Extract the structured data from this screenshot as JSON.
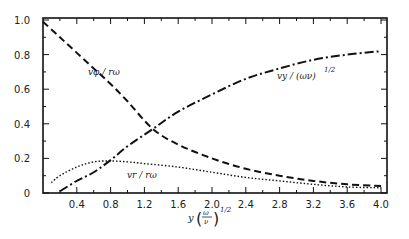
{
  "chart_data": {
    "type": "line",
    "title": "",
    "xlabel": "y(ω/ν)^1/2",
    "ylabel": "",
    "xlim": [
      0,
      4.0
    ],
    "ylim": [
      0,
      1.0
    ],
    "grid": false,
    "legend": "none (inline curve labels)",
    "x_ticks": [
      "0.4",
      "0.8",
      "1.2",
      "1.6",
      "2.0",
      "2.4",
      "2.8",
      "3.2",
      "3.6",
      "4.0"
    ],
    "y_ticks": [
      "0",
      "0.2",
      "0.4",
      "0.6",
      "0.8",
      "1.0"
    ],
    "series": [
      {
        "name": "v_φ / rω",
        "style": "dashed",
        "x": [
          0,
          0.2,
          0.4,
          0.6,
          0.8,
          1.0,
          1.3,
          1.6,
          2.0,
          2.4,
          2.8,
          3.2,
          3.6,
          4.0
        ],
        "y": [
          0.99,
          0.9,
          0.81,
          0.72,
          0.63,
          0.53,
          0.37,
          0.28,
          0.2,
          0.14,
          0.1,
          0.07,
          0.05,
          0.04
        ]
      },
      {
        "name": "v_y / (ων)^1/2",
        "style": "dash-dot",
        "x": [
          0.2,
          0.4,
          0.6,
          0.8,
          1.0,
          1.3,
          1.6,
          2.0,
          2.4,
          2.8,
          3.2,
          3.6,
          4.0
        ],
        "y": [
          0.01,
          0.07,
          0.12,
          0.19,
          0.27,
          0.37,
          0.47,
          0.57,
          0.66,
          0.72,
          0.77,
          0.8,
          0.82
        ]
      },
      {
        "name": "v_r / rω",
        "style": "dotted",
        "x": [
          0.1,
          0.2,
          0.4,
          0.6,
          0.8,
          1.0,
          1.2,
          1.6,
          2.0,
          2.4,
          2.8,
          3.2,
          3.6,
          4.0
        ],
        "y": [
          0.06,
          0.1,
          0.15,
          0.18,
          0.185,
          0.18,
          0.17,
          0.15,
          0.12,
          0.09,
          0.07,
          0.05,
          0.035,
          0.03
        ]
      }
    ],
    "annotations": [
      {
        "text": "v_φ / rω",
        "x": 0.7,
        "y": 0.71
      },
      {
        "text": "v_y / (ων)^1/2",
        "x": 2.9,
        "y": 0.68
      },
      {
        "text": "v_r / rω",
        "x": 1.35,
        "y": 0.1
      }
    ]
  },
  "labels": {
    "phi": "vφ / rω",
    "vy": "vy / (ων)",
    "vy_exp": "1/2",
    "vr": "vr / rω",
    "xaxis_y": "y",
    "xaxis_num": "ω",
    "xaxis_den": "ν",
    "xaxis_exp": "1/2"
  }
}
